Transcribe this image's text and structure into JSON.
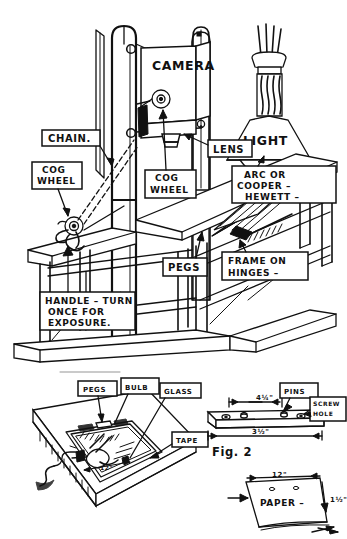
{
  "figure": {
    "title_caption": "Fig. 2",
    "domain_kind": "technical-line-drawing",
    "ink_color": "#111111",
    "paper_color": "#ffffff"
  },
  "main_apparatus": {
    "labels": {
      "camera": "CAMERA",
      "light": "LIGHT",
      "chain": "CHAIN.",
      "cog_wheel_left": "COG\nWHEEL",
      "cog_wheel_left_line1": "COG",
      "cog_wheel_left_line2": "WHEEL",
      "cog_wheel_mid_line1": "COG",
      "cog_wheel_mid_line2": "WHEEL",
      "lens": "LENS",
      "arc_line1": "ARC  OR",
      "arc_line2": "COOPER –",
      "arc_line3": "HEWETT –",
      "pegs": "PEGS",
      "frame_line1": "FRAME ON",
      "frame_line2": "HINGES –",
      "handle_line1": "HANDLE – TURN",
      "handle_line2": "ONCE FOR",
      "handle_line3": "EXPOSURE."
    }
  },
  "lower_left_diagram": {
    "labels": {
      "pegs": "PEGS",
      "bulb": "BULB",
      "glass": "GLASS",
      "tape": "TAPE"
    },
    "dimensions": {
      "inner_width": "12\""
    }
  },
  "fig2_diagram": {
    "caption": "Fig. 2",
    "labels": {
      "pins": "PINS",
      "screw_hole_line1": "SCREW",
      "screw_hole_line2": "HOLE"
    },
    "dimensions": {
      "inner_span": "4¼\"",
      "total_span": "3½\""
    }
  },
  "paper_diagram": {
    "labels": {
      "paper": "PAPER –"
    },
    "dimensions": {
      "width": "12\"",
      "side": "1½\""
    }
  }
}
